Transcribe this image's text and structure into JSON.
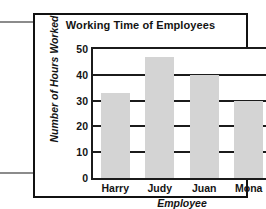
{
  "chart_data": {
    "type": "bar",
    "title": "Working Time of Employees",
    "xlabel": "Employee",
    "ylabel": "Number of Hours Worked",
    "categories": [
      "Harry",
      "Judy",
      "Juan",
      "Mona"
    ],
    "values": [
      33,
      47,
      40,
      30
    ],
    "yticks": [
      0,
      10,
      20,
      30,
      40,
      50
    ],
    "ylim": [
      0,
      50
    ],
    "grid": true,
    "legend": null,
    "bar_color": "#d4d4d4",
    "axis_color": "#1b1b1b"
  },
  "annotations": {
    "arrow_top": "arrow-pointing-right",
    "arrow_bottom": "arrow-pointing-right",
    "arrow_color": "#8b8b8b"
  },
  "frame": {
    "border_color": "#111111"
  }
}
